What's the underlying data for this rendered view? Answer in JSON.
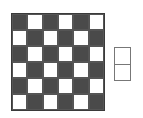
{
  "board": {
    "rows": 6,
    "cols": 6,
    "cells": [
      [
        "dark",
        "light",
        "dark",
        "light",
        "dark",
        "light"
      ],
      [
        "light",
        "dark",
        "light",
        "dark",
        "light",
        "dark"
      ],
      [
        "dark",
        "light",
        "dark",
        "light",
        "dark",
        "light"
      ],
      [
        "light",
        "dark",
        "light",
        "dark",
        "light",
        "dark"
      ],
      [
        "dark",
        "light",
        "dark",
        "light",
        "dark",
        "light"
      ],
      [
        "light",
        "dark",
        "light",
        "dark",
        "light",
        "dark"
      ]
    ],
    "colors": {
      "dark": "#4a4a4a",
      "light": "#ffffff",
      "border": "#3a3a3a"
    }
  },
  "domino": {
    "orientation": "vertical",
    "squares": 2,
    "color": "#ffffff",
    "border": "#777777"
  }
}
